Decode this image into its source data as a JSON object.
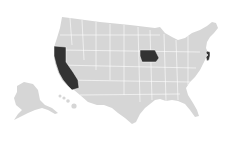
{
  "map": {
    "title": "",
    "base_color": "#d6d6d6",
    "highlight_color": "#333333",
    "background": "#ffffff",
    "highlighted_states": [
      "California",
      "Iowa",
      "New Jersey"
    ]
  }
}
